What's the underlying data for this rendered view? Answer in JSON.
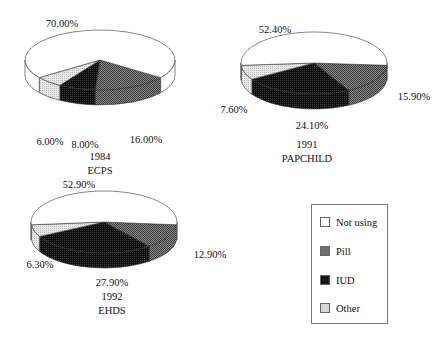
{
  "chart_data": [
    {
      "type": "pie",
      "title": "1984",
      "subtitle": "ECPS",
      "categories": [
        "Not using",
        "Pill",
        "IUD",
        "Other"
      ],
      "values": [
        70.0,
        16.0,
        8.0,
        6.0
      ],
      "labels": [
        "70.00%",
        "16.00%",
        "8.00%",
        "6.00%"
      ],
      "style": "3d"
    },
    {
      "type": "pie",
      "title": "1991",
      "subtitle": "PAPCHILD",
      "categories": [
        "Not using",
        "Pill",
        "IUD",
        "Other"
      ],
      "values": [
        52.4,
        15.9,
        24.1,
        7.6
      ],
      "labels": [
        "52.40%",
        "15.90%",
        "24.10%",
        "7.60%"
      ],
      "style": "3d"
    },
    {
      "type": "pie",
      "title": "1992",
      "subtitle": "EHDS",
      "categories": [
        "Not using",
        "Pill",
        "IUD",
        "Other"
      ],
      "values": [
        52.9,
        12.9,
        27.9,
        6.3
      ],
      "labels": [
        "52.90%",
        "12.90%",
        "27.90%",
        "6.30%"
      ],
      "style": "3d"
    }
  ],
  "legend": {
    "items": [
      {
        "label": "Not using",
        "color": "#ffffff"
      },
      {
        "label": "Pill",
        "color": "#6e6e6e"
      },
      {
        "label": "IUD",
        "color": "#161616"
      },
      {
        "label": "Other",
        "color": "#d8d8d8"
      }
    ]
  },
  "pies": [
    {
      "cx": 100,
      "cy": 60,
      "rx": 75,
      "ry": 30,
      "depth": 15,
      "pct_positions": [
        [
          62,
          27
        ],
        [
          146,
          143
        ],
        [
          85,
          148
        ],
        [
          50,
          145
        ]
      ],
      "title_pos": [
        100,
        160
      ],
      "subtitle_pos": [
        100,
        174
      ]
    },
    {
      "cx": 314,
      "cy": 63,
      "rx": 73,
      "ry": 31,
      "depth": 15,
      "pct_positions": [
        [
          275,
          33
        ],
        [
          414,
          100
        ],
        [
          312,
          129
        ],
        [
          234,
          113
        ]
      ],
      "title_pos": [
        307,
        148
      ],
      "subtitle_pos": [
        307,
        162
      ]
    },
    {
      "cx": 104,
      "cy": 222,
      "rx": 73,
      "ry": 31,
      "depth": 15,
      "pct_positions": [
        [
          79,
          188
        ],
        [
          210,
          258
        ],
        [
          112,
          286
        ],
        [
          40,
          268
        ]
      ],
      "title_pos": [
        112,
        300
      ],
      "subtitle_pos": [
        112,
        314
      ]
    }
  ]
}
